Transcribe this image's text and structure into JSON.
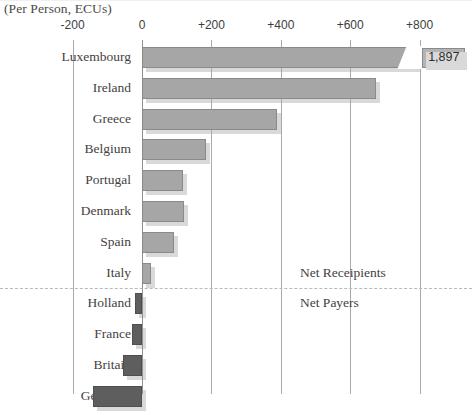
{
  "subtitle": "(Per Person, ECUs)",
  "annotations": {
    "recipients": "Net Receipients",
    "payers": "Net Payers",
    "luxembourg_callout": "1,897"
  },
  "axis": {
    "ticks": [
      "-200",
      "0",
      "+200",
      "+400",
      "+600",
      "+800"
    ],
    "tick_values": [
      -200,
      0,
      200,
      400,
      600,
      800
    ]
  },
  "colors": {
    "positive_bar": "#a6a6a6",
    "negative_bar": "#5e5e5e",
    "bar_shadow": "#d9d9d9",
    "gridline": "#a9a9a9",
    "text": "#44413f",
    "divider": "#b9b9b9"
  },
  "chart_data": {
    "type": "bar",
    "orientation": "horizontal",
    "title": "",
    "subtitle": "(Per Person, ECUs)",
    "xlabel": "",
    "ylabel": "",
    "xlim": [
      -200,
      900
    ],
    "grid": true,
    "legend": "none",
    "categories": [
      "Luxembourg",
      "Ireland",
      "Greece",
      "Belgium",
      "Portugal",
      "Denmark",
      "Spain",
      "Italy",
      "Holland",
      "France",
      "Britain",
      "Germany"
    ],
    "values": [
      1897,
      675,
      390,
      185,
      118,
      122,
      92,
      25,
      -20,
      -28,
      -55,
      -140
    ],
    "display_values": {
      "Luxembourg": "1,897"
    },
    "notes": [
      "Luxembourg bar is truncated with a broken-axis wedge; true value 1,897 shown in callout box.",
      "Dashed separator between Net Receipients (positive) and Net Payers (negative)."
    ],
    "groups": [
      {
        "name": "Net Receipients",
        "categories": [
          "Luxembourg",
          "Ireland",
          "Greece",
          "Belgium",
          "Portugal",
          "Denmark",
          "Spain",
          "Italy"
        ]
      },
      {
        "name": "Net Payers",
        "categories": [
          "Holland",
          "France",
          "Britain",
          "Germany"
        ]
      }
    ]
  }
}
